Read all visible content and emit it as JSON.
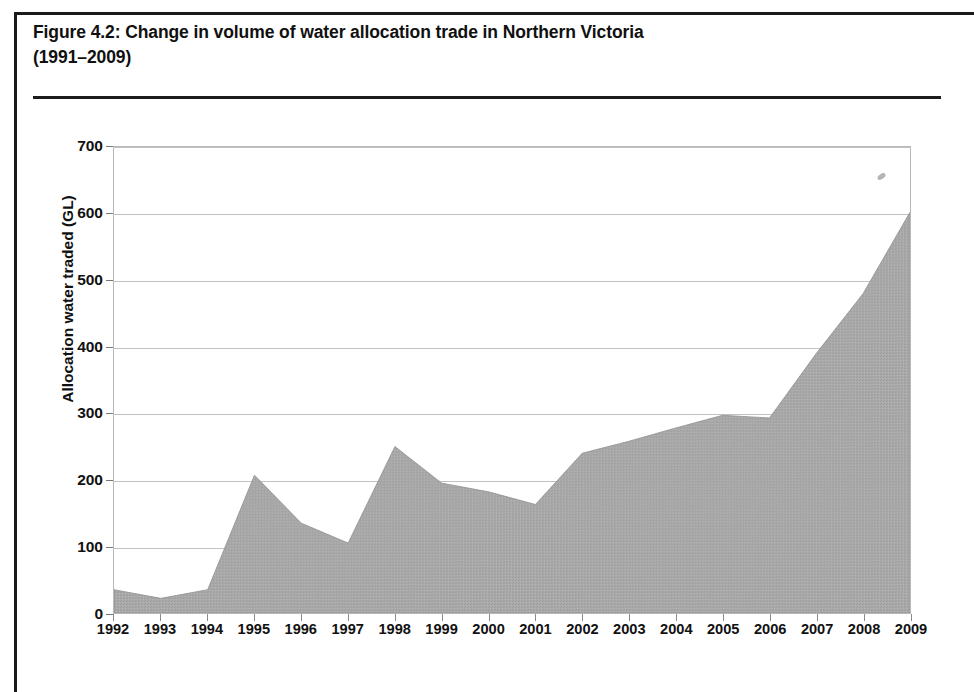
{
  "figure": {
    "label": "Figure 4.2:",
    "title_line1": "Change in volume of water allocation trade in Northern Victoria",
    "title_line2": "(1991–2009)"
  },
  "chart_data": {
    "type": "area",
    "title": "Change in volume of water allocation trade in Northern Victoria (1991–2009)",
    "xlabel": "",
    "ylabel": "Allocation water traded (GL)",
    "ylim": [
      0,
      700
    ],
    "ytick_labels": [
      "0",
      "100",
      "200",
      "300",
      "400",
      "500",
      "600",
      "700"
    ],
    "yticks": [
      0,
      100,
      200,
      300,
      400,
      500,
      600,
      700
    ],
    "grid": true,
    "legend": "none",
    "fill_color": "#a8a8a8",
    "categories": [
      "1992",
      "1993",
      "1994",
      "1995",
      "1996",
      "1997",
      "1998",
      "1999",
      "2000",
      "2001",
      "2002",
      "2003",
      "2004",
      "2005",
      "2006",
      "2007",
      "2008",
      "2009"
    ],
    "x": [
      1992,
      1993,
      1994,
      1995,
      1996,
      1997,
      1998,
      1999,
      2000,
      2001,
      2002,
      2003,
      2004,
      2005,
      2006,
      2007,
      2008,
      2009
    ],
    "values": [
      35,
      22,
      35,
      207,
      135,
      105,
      250,
      195,
      182,
      163,
      240,
      258,
      278,
      297,
      293,
      390,
      480,
      602
    ],
    "series": [
      {
        "name": "Allocation water traded (GL)",
        "values": [
          35,
          22,
          35,
          207,
          135,
          105,
          250,
          195,
          182,
          163,
          240,
          258,
          278,
          297,
          293,
          390,
          480,
          602
        ]
      }
    ]
  }
}
